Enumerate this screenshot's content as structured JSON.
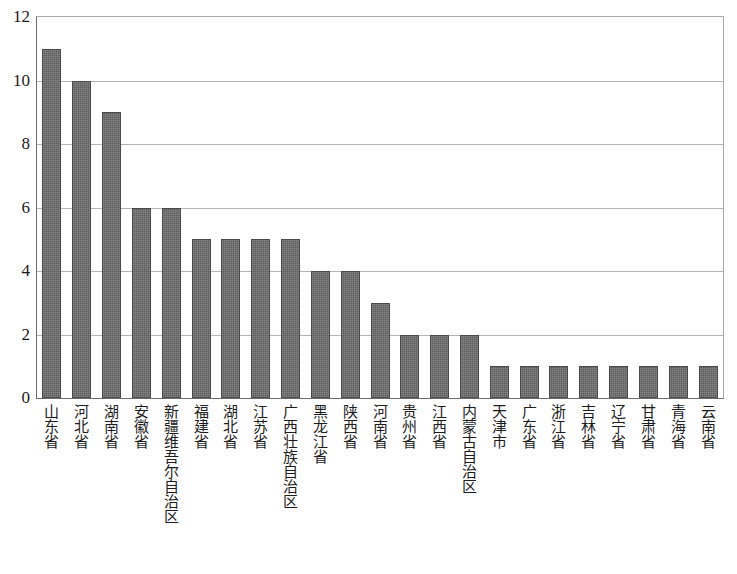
{
  "chart_data": {
    "type": "bar",
    "title": "",
    "subtitle": "",
    "xlabel": "",
    "ylabel": "",
    "ylim": [
      0,
      12
    ],
    "y_ticks": [
      0,
      2,
      4,
      6,
      8,
      10,
      12
    ],
    "y_tick_labels": [
      "0",
      "2",
      "4",
      "6",
      "8",
      "10",
      "12"
    ],
    "grid": true,
    "grid_axis": "y",
    "legend": false,
    "legend_position": "none",
    "bar_color": "#5c5c5c",
    "bar_edge_color": "#4a4a4a",
    "gridline_color": "#b4b4b4",
    "axis_color": "#6e6e6e",
    "plot_background": "#ffffff",
    "orientation": "vertical",
    "categories": [
      "山东省",
      "河北省",
      "湖南省",
      "安徽省",
      "新疆维吾尔自治区",
      "福建省",
      "湖北省",
      "江苏省",
      "广西壮族自治区",
      "黑龙江省",
      "陕西省",
      "河南省",
      "贵州省",
      "江西省",
      "内蒙古自治区",
      "天津市",
      "广东省",
      "浙江省",
      "吉林省",
      "辽宁省",
      "甘肃省",
      "青海省",
      "云南省"
    ],
    "values": [
      11,
      10,
      9,
      6,
      6,
      5,
      5,
      5,
      5,
      4,
      4,
      3,
      2,
      2,
      2,
      1,
      1,
      1,
      1,
      1,
      1,
      1,
      1
    ]
  }
}
